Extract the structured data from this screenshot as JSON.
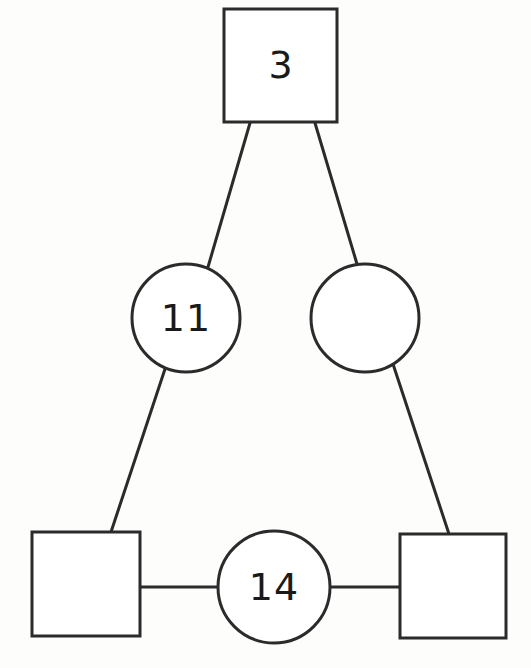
{
  "diagram": {
    "title": "",
    "background_color": "#fdfdfc",
    "stroke_color": "#2b2b2b",
    "fill_color": "#ffffff",
    "stroke_width": 3,
    "nodes": [
      {
        "id": "top-square",
        "shape": "square",
        "label": "3",
        "x": 224,
        "y": 9,
        "width": 113,
        "height": 113,
        "cx": 280,
        "cy": 65
      },
      {
        "id": "left-circle",
        "shape": "circle",
        "label": "11",
        "cx": 186,
        "cy": 318,
        "r": 54
      },
      {
        "id": "right-circle",
        "shape": "circle",
        "label": "",
        "cx": 365,
        "cy": 318,
        "r": 54
      },
      {
        "id": "bottom-left-square",
        "shape": "square",
        "label": "",
        "x": 32,
        "y": 532,
        "width": 108,
        "height": 104,
        "cx": 86,
        "cy": 584
      },
      {
        "id": "bottom-center-circle",
        "shape": "circle",
        "label": "14",
        "cx": 274,
        "cy": 587,
        "r": 56
      },
      {
        "id": "bottom-right-square",
        "shape": "square",
        "label": "",
        "x": 400,
        "y": 534,
        "width": 106,
        "height": 104,
        "cx": 453,
        "cy": 586
      }
    ],
    "edges": [
      {
        "id": "edge-top-to-left-circle",
        "from": "top-square",
        "to": "left-circle",
        "x1": 250,
        "y1": 123,
        "x2": 208,
        "y2": 267
      },
      {
        "id": "edge-top-to-right-circle",
        "from": "top-square",
        "to": "right-circle",
        "x1": 315,
        "y1": 123,
        "x2": 357,
        "y2": 264
      },
      {
        "id": "edge-left-circle-to-bottom-left-square",
        "from": "left-circle",
        "to": "bottom-left-square",
        "x1": 165,
        "y1": 369,
        "x2": 111,
        "y2": 532
      },
      {
        "id": "edge-right-circle-to-bottom-right-square",
        "from": "right-circle",
        "to": "bottom-right-square",
        "x1": 393,
        "y1": 364,
        "x2": 449,
        "y2": 534
      },
      {
        "id": "edge-bottom-left-square-to-center-circle",
        "from": "bottom-left-square",
        "to": "bottom-center-circle",
        "x1": 140,
        "y1": 587,
        "x2": 219,
        "y2": 587
      },
      {
        "id": "edge-center-circle-to-bottom-right-square",
        "from": "bottom-center-circle",
        "to": "bottom-right-square",
        "x1": 330,
        "y1": 587,
        "x2": 400,
        "y2": 587
      }
    ]
  }
}
